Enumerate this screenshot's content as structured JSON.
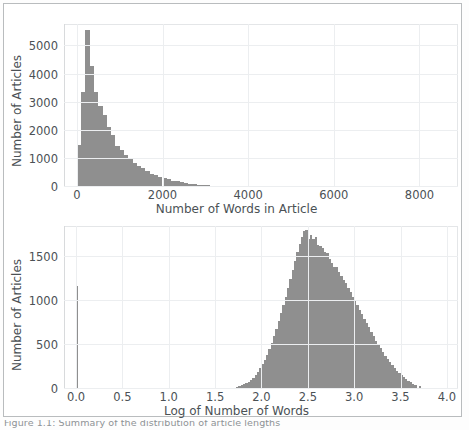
{
  "figure": {
    "caption": "Figure 1.1: Summary of the distribution of article lengths",
    "bar_color": "#8f8f8f",
    "grid_color": "#eceef0",
    "axis_color": "#4b5155"
  },
  "panels": [
    {
      "name": "words-histogram",
      "ylabel": "Number of Articles",
      "xlabel": "Number of Words in Article",
      "yticks": [
        "0",
        "1000",
        "2000",
        "3000",
        "4000",
        "5000"
      ],
      "xticks": [
        "0",
        "2000",
        "4000",
        "6000",
        "8000"
      ]
    },
    {
      "name": "log-words-histogram",
      "ylabel": "Number of Articles",
      "xlabel": "Log of Number of Words",
      "yticks": [
        "0",
        "500",
        "1000",
        "1500"
      ],
      "xticks": [
        "0.0",
        "0.5",
        "1.0",
        "1.5",
        "2.0",
        "2.5",
        "3.0",
        "3.5",
        "4.0"
      ]
    }
  ],
  "chart_data": [
    {
      "type": "bar",
      "name": "words-histogram",
      "title": "",
      "xlabel": "Number of Words in Article",
      "ylabel": "Number of Articles",
      "xlim": [
        -300,
        8900
      ],
      "ylim": [
        0,
        5800
      ],
      "xticks": [
        0,
        2000,
        4000,
        6000,
        8000
      ],
      "yticks": [
        0,
        1000,
        2000,
        3000,
        4000,
        5000
      ],
      "grid": true,
      "legend": null,
      "bin_width": 100,
      "bin_starts": [
        0,
        100,
        200,
        300,
        400,
        500,
        600,
        700,
        800,
        900,
        1000,
        1100,
        1200,
        1300,
        1400,
        1500,
        1600,
        1700,
        1800,
        1900,
        2000,
        2100,
        2200,
        2300,
        2400,
        2500,
        2600,
        2700,
        2800,
        2900,
        3000,
        3100,
        3200,
        3300,
        3400,
        3500,
        3600,
        3700,
        3800,
        3900,
        4000,
        4100,
        4200,
        4300,
        4400,
        4500,
        4600,
        4700,
        4800,
        4900,
        5000,
        5200,
        5400,
        5600,
        5800,
        6000,
        6500,
        7000,
        7500,
        8000
      ],
      "values": [
        1480,
        3380,
        5600,
        4320,
        3380,
        2880,
        2560,
        2150,
        1840,
        1470,
        1320,
        1130,
        980,
        860,
        760,
        680,
        560,
        480,
        420,
        360,
        320,
        270,
        230,
        200,
        170,
        140,
        120,
        100,
        85,
        72,
        60,
        52,
        45,
        38,
        33,
        28,
        24,
        21,
        18,
        16,
        14,
        12,
        11,
        9,
        8,
        7,
        6,
        6,
        5,
        5,
        4,
        4,
        3,
        3,
        2,
        2,
        2,
        1,
        1,
        1
      ]
    },
    {
      "type": "bar",
      "name": "log-words-histogram",
      "title": "",
      "xlabel": "Log of Number of Words",
      "ylabel": "Number of Articles",
      "xlim": [
        -0.13,
        4.12
      ],
      "ylim": [
        0,
        1850
      ],
      "xticks": [
        0.0,
        0.5,
        1.0,
        1.5,
        2.0,
        2.5,
        3.0,
        3.5,
        4.0
      ],
      "yticks": [
        0,
        500,
        1000,
        1500
      ],
      "grid": true,
      "legend": null,
      "bin_width": 0.025,
      "bin_starts": [
        0.0,
        1.7,
        1.725,
        1.75,
        1.775,
        1.8,
        1.825,
        1.85,
        1.875,
        1.9,
        1.925,
        1.95,
        1.975,
        2.0,
        2.025,
        2.05,
        2.075,
        2.1,
        2.125,
        2.15,
        2.175,
        2.2,
        2.225,
        2.25,
        2.275,
        2.3,
        2.325,
        2.35,
        2.375,
        2.4,
        2.425,
        2.45,
        2.475,
        2.5,
        2.525,
        2.55,
        2.575,
        2.6,
        2.625,
        2.65,
        2.675,
        2.7,
        2.725,
        2.75,
        2.775,
        2.8,
        2.825,
        2.85,
        2.875,
        2.9,
        2.925,
        2.95,
        2.975,
        3.0,
        3.025,
        3.05,
        3.075,
        3.1,
        3.125,
        3.15,
        3.175,
        3.2,
        3.225,
        3.25,
        3.275,
        3.3,
        3.325,
        3.35,
        3.375,
        3.4,
        3.425,
        3.45,
        3.475,
        3.5,
        3.525,
        3.55,
        3.575,
        3.6,
        3.625,
        3.65,
        3.7,
        3.75,
        3.8
      ],
      "values": [
        1170,
        15,
        22,
        30,
        40,
        52,
        68,
        85,
        105,
        130,
        160,
        195,
        235,
        280,
        330,
        390,
        450,
        520,
        600,
        680,
        770,
        860,
        950,
        1050,
        1150,
        1250,
        1350,
        1450,
        1560,
        1650,
        1720,
        1790,
        1810,
        1700,
        1750,
        1700,
        1720,
        1640,
        1620,
        1600,
        1560,
        1540,
        1480,
        1430,
        1390,
        1380,
        1330,
        1280,
        1240,
        1200,
        1150,
        1100,
        1050,
        1000,
        950,
        900,
        850,
        800,
        750,
        700,
        650,
        600,
        550,
        505,
        460,
        420,
        380,
        340,
        305,
        270,
        240,
        210,
        185,
        160,
        135,
        115,
        95,
        78,
        62,
        48,
        30,
        16,
        7
      ]
    }
  ]
}
